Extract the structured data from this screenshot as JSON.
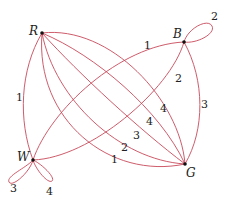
{
  "diagram": {
    "type": "multigraph",
    "edge_color": "#c84a5a",
    "nodes": [
      {
        "id": "R",
        "label": "R"
      },
      {
        "id": "B",
        "label": "B"
      },
      {
        "id": "W",
        "label": "W"
      },
      {
        "id": "G",
        "label": "G"
      }
    ],
    "edges": [
      {
        "from": "R",
        "to": "W",
        "label": "1"
      },
      {
        "from": "W",
        "to": "B",
        "label": "1"
      },
      {
        "from": "W",
        "to": "B",
        "label": "2"
      },
      {
        "from": "B",
        "to": "G",
        "label": "3"
      },
      {
        "from": "B",
        "to": "B",
        "label": "2"
      },
      {
        "from": "W",
        "to": "W",
        "label": "3"
      },
      {
        "from": "W",
        "to": "W",
        "label": "4"
      },
      {
        "from": "R",
        "to": "G",
        "label": "4"
      },
      {
        "from": "R",
        "to": "G",
        "label": "4"
      },
      {
        "from": "R",
        "to": "G",
        "label": "3"
      },
      {
        "from": "R",
        "to": "G",
        "label": "2"
      },
      {
        "from": "R",
        "to": "G",
        "label": "1"
      }
    ]
  }
}
